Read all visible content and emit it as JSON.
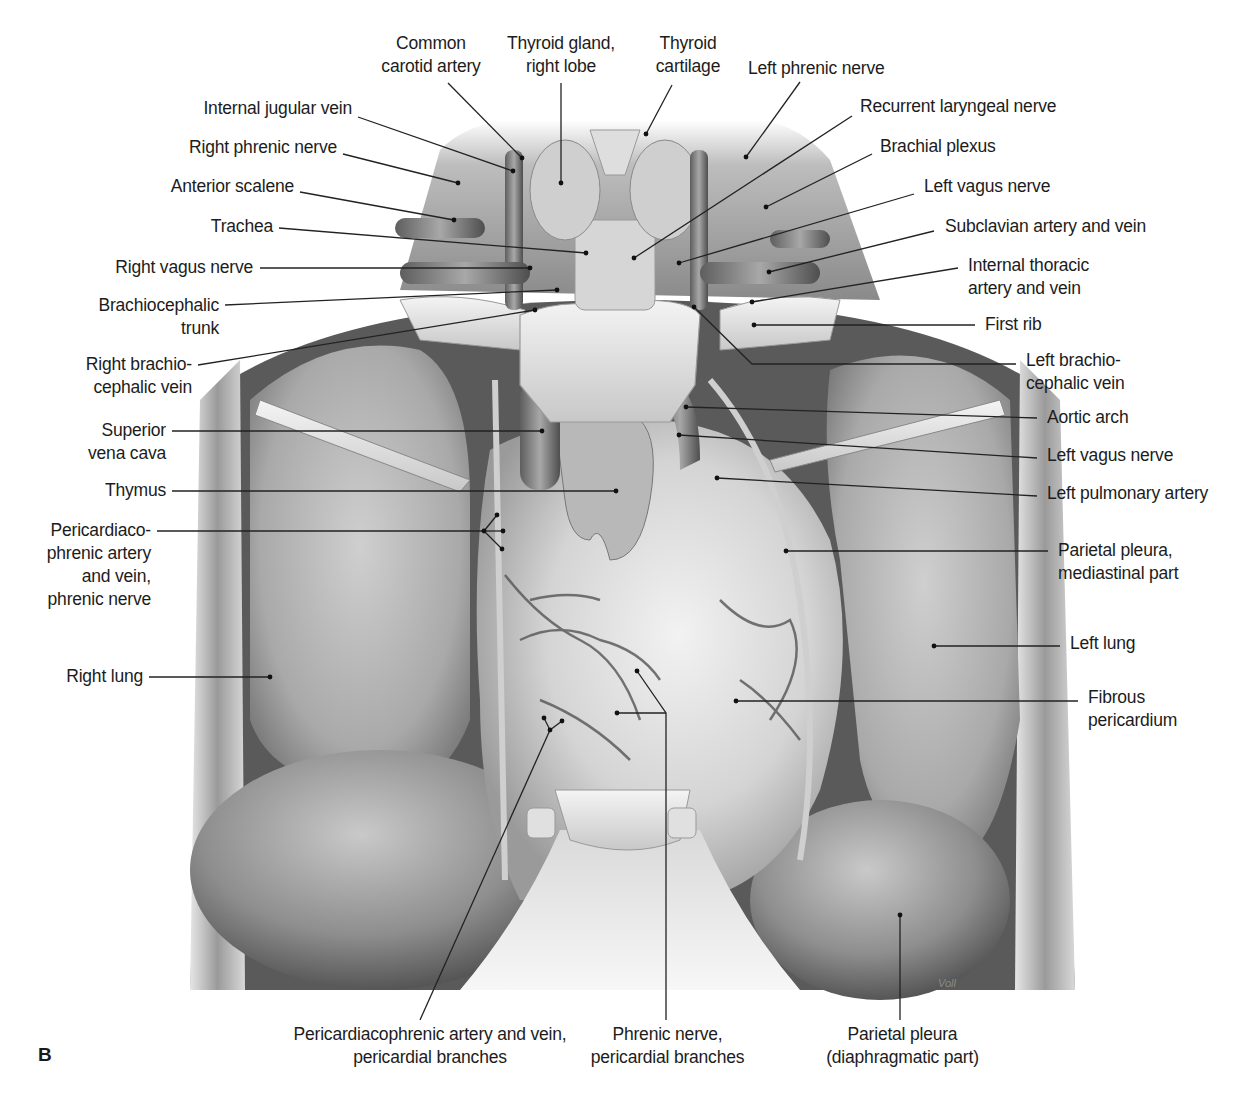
{
  "figure": {
    "panel_letter": "B",
    "artist_signature": "Voll",
    "colors": {
      "background": "#ffffff",
      "ink": "#1c1c1c",
      "leader_line": "#222222"
    }
  },
  "labels": [
    {
      "id": "common-carotid-artery",
      "lines": [
        "Common",
        "carotid artery"
      ],
      "align": "c",
      "x": 376,
      "y": 32,
      "w": 110,
      "pointer": [
        [
          448,
          83
        ],
        [
          522,
          158
        ]
      ]
    },
    {
      "id": "thyroid-gland-right-lobe",
      "lines": [
        "Thyroid gland,",
        "right lobe"
      ],
      "align": "c",
      "x": 500,
      "y": 32,
      "w": 122,
      "pointer": [
        [
          561,
          83
        ],
        [
          561,
          183
        ]
      ]
    },
    {
      "id": "thyroid-cartilage",
      "lines": [
        "Thyroid",
        "cartilage"
      ],
      "align": "c",
      "x": 648,
      "y": 32,
      "w": 80,
      "pointer": [
        [
          672,
          85
        ],
        [
          646,
          134
        ]
      ]
    },
    {
      "id": "left-phrenic-nerve",
      "lines": [
        "Left phrenic nerve"
      ],
      "align": "l",
      "x": 748,
      "y": 57,
      "w": 160,
      "pointer": [
        [
          800,
          82
        ],
        [
          746,
          157
        ]
      ]
    },
    {
      "id": "recurrent-laryngeal-nerve",
      "lines": [
        "Recurrent laryngeal nerve"
      ],
      "align": "l",
      "x": 860,
      "y": 95,
      "w": 220,
      "pointer": [
        [
          852,
          116
        ],
        [
          634,
          258
        ]
      ]
    },
    {
      "id": "brachial-plexus",
      "lines": [
        "Brachial plexus"
      ],
      "align": "l",
      "x": 880,
      "y": 135,
      "w": 140,
      "pointer": [
        [
          872,
          154
        ],
        [
          766,
          207
        ]
      ]
    },
    {
      "id": "left-vagus-nerve-upper",
      "lines": [
        "Left vagus nerve"
      ],
      "align": "l",
      "x": 924,
      "y": 175,
      "w": 150,
      "pointer": [
        [
          914,
          194
        ],
        [
          679,
          263
        ]
      ]
    },
    {
      "id": "subclavian-artery-and-vein",
      "lines": [
        "Subclavian artery and vein"
      ],
      "align": "l",
      "x": 945,
      "y": 215,
      "w": 220,
      "pointer": [
        [
          934,
          231
        ],
        [
          769,
          272
        ]
      ]
    },
    {
      "id": "internal-thoracic-artery-and-vein",
      "lines": [
        "Internal thoracic",
        "artery and vein"
      ],
      "align": "l",
      "x": 968,
      "y": 254,
      "w": 150,
      "pointer": [
        [
          958,
          268
        ],
        [
          752,
          302
        ]
      ]
    },
    {
      "id": "first-rib",
      "lines": [
        "First rib"
      ],
      "align": "l",
      "x": 985,
      "y": 313,
      "w": 80,
      "pointer": [
        [
          975,
          325
        ],
        [
          754,
          325
        ]
      ]
    },
    {
      "id": "internal-jugular-vein",
      "lines": [
        "Internal jugular vein"
      ],
      "align": "r",
      "x": 150,
      "y": 97,
      "w": 202,
      "pointer": [
        [
          358,
          117
        ],
        [
          513,
          171
        ]
      ]
    },
    {
      "id": "right-phrenic-nerve",
      "lines": [
        "Right phrenic nerve"
      ],
      "align": "r",
      "x": 150,
      "y": 136,
      "w": 187,
      "pointer": [
        [
          343,
          154
        ],
        [
          458,
          183
        ]
      ]
    },
    {
      "id": "anterior-scalene",
      "lines": [
        "Anterior scalene"
      ],
      "align": "r",
      "x": 140,
      "y": 175,
      "w": 154,
      "pointer": [
        [
          300,
          192
        ],
        [
          454,
          220
        ]
      ]
    },
    {
      "id": "trachea",
      "lines": [
        "Trachea"
      ],
      "align": "r",
      "x": 190,
      "y": 215,
      "w": 83,
      "pointer": [
        [
          279,
          228
        ],
        [
          586,
          253
        ]
      ]
    },
    {
      "id": "right-vagus-nerve",
      "lines": [
        "Right vagus nerve"
      ],
      "align": "r",
      "x": 90,
      "y": 256,
      "w": 163,
      "pointer": [
        [
          260,
          268
        ],
        [
          530,
          268
        ]
      ]
    },
    {
      "id": "brachiocephalic-trunk",
      "lines": [
        "Brachiocephalic",
        "trunk"
      ],
      "align": "r",
      "x": 60,
      "y": 294,
      "w": 159,
      "pointer": [
        [
          225,
          305
        ],
        [
          557,
          290
        ]
      ]
    },
    {
      "id": "right-brachiocephalic-vein",
      "lines": [
        "Right brachio-",
        "cephalic vein"
      ],
      "align": "r",
      "x": 60,
      "y": 353,
      "w": 132,
      "pointer": [
        [
          198,
          365
        ],
        [
          535,
          310
        ]
      ]
    },
    {
      "id": "left-brachiocephalic-vein",
      "lines": [
        "Left brachio-",
        "cephalic vein"
      ],
      "align": "l",
      "x": 1026,
      "y": 349,
      "w": 130,
      "pointer": [
        [
          1016,
          364
        ],
        [
          752,
          364
        ],
        [
          694,
          307
        ]
      ]
    },
    {
      "id": "aortic-arch",
      "lines": [
        "Aortic arch"
      ],
      "align": "l",
      "x": 1047,
      "y": 406,
      "w": 110,
      "pointer": [
        [
          1037,
          418
        ],
        [
          686,
          407
        ]
      ]
    },
    {
      "id": "left-vagus-nerve-lower",
      "lines": [
        "Left vagus nerve"
      ],
      "align": "l",
      "x": 1047,
      "y": 444,
      "w": 150,
      "pointer": [
        [
          1037,
          458
        ],
        [
          679,
          435
        ]
      ]
    },
    {
      "id": "left-pulmonary-artery",
      "lines": [
        "Left pulmonary artery"
      ],
      "align": "l",
      "x": 1047,
      "y": 482,
      "w": 190,
      "pointer": [
        [
          1037,
          496
        ],
        [
          717,
          478
        ]
      ]
    },
    {
      "id": "superior-vena-cava",
      "lines": [
        "Superior",
        "vena cava"
      ],
      "align": "r",
      "x": 70,
      "y": 419,
      "w": 96,
      "pointer": [
        [
          172,
          431
        ],
        [
          542,
          431
        ]
      ]
    },
    {
      "id": "thymus",
      "lines": [
        "Thymus"
      ],
      "align": "r",
      "x": 90,
      "y": 479,
      "w": 76,
      "pointer": [
        [
          172,
          491
        ],
        [
          616,
          491
        ]
      ]
    },
    {
      "id": "pericardiacophrenic-artery-and-vein-phrenic-nerve",
      "lines": [
        "Pericardiaco-",
        "phrenic artery",
        "and vein,",
        "phrenic nerve"
      ],
      "align": "r",
      "x": 20,
      "y": 519,
      "w": 131,
      "pointer": [
        [
          157,
          531
        ],
        [
          484,
          531
        ]
      ],
      "fork": [
        [
          484,
          531
        ],
        [
          497,
          515
        ],
        [
          484,
          531
        ],
        [
          502,
          549
        ],
        [
          484,
          531
        ],
        [
          503,
          531
        ]
      ]
    },
    {
      "id": "parietal-pleura-mediastinal-part",
      "lines": [
        "Parietal pleura,",
        "mediastinal part"
      ],
      "align": "l",
      "x": 1058,
      "y": 539,
      "w": 150,
      "pointer": [
        [
          1048,
          551
        ],
        [
          786,
          551
        ]
      ]
    },
    {
      "id": "left-lung",
      "lines": [
        "Left lung"
      ],
      "align": "l",
      "x": 1070,
      "y": 632,
      "w": 100,
      "pointer": [
        [
          1060,
          646
        ],
        [
          934,
          646
        ]
      ]
    },
    {
      "id": "right-lung",
      "lines": [
        "Right lung"
      ],
      "align": "r",
      "x": 40,
      "y": 665,
      "w": 103,
      "pointer": [
        [
          149,
          677
        ],
        [
          270,
          677
        ]
      ]
    },
    {
      "id": "fibrous-pericardium",
      "lines": [
        "Fibrous",
        "pericardium"
      ],
      "align": "l",
      "x": 1088,
      "y": 686,
      "w": 110,
      "pointer": [
        [
          1078,
          701
        ],
        [
          736,
          701
        ]
      ]
    },
    {
      "id": "pericardiacophrenic-artery-and-vein-pericardial-branches",
      "lines": [
        "Pericardiacophrenic artery and vein,",
        "pericardial branches"
      ],
      "align": "c",
      "x": 265,
      "y": 1023,
      "w": 330,
      "pointer": [
        [
          420,
          1020
        ],
        [
          550,
          730
        ]
      ],
      "fork": [
        [
          550,
          730
        ],
        [
          544,
          718
        ],
        [
          550,
          730
        ],
        [
          562,
          721
        ]
      ]
    },
    {
      "id": "phrenic-nerve-pericardial-branches",
      "lines": [
        "Phrenic nerve,",
        "pericardial branches"
      ],
      "align": "c",
      "x": 580,
      "y": 1023,
      "w": 175,
      "pointer": [
        [
          666,
          1020
        ],
        [
          666,
          713
        ],
        [
          637,
          671
        ]
      ],
      "fork": [
        [
          666,
          713
        ],
        [
          617,
          713
        ]
      ]
    },
    {
      "id": "parietal-pleura-diaphragmatic-part",
      "lines": [
        "Parietal pleura",
        "(diaphragmatic part)"
      ],
      "align": "c",
      "x": 815,
      "y": 1023,
      "w": 175,
      "pointer": [
        [
          900,
          1020
        ],
        [
          900,
          915
        ]
      ]
    }
  ]
}
